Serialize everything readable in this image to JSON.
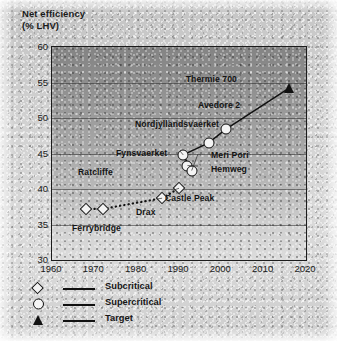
{
  "chart_data": {
    "type": "scatter",
    "title": "",
    "ylabel": "Net efficiency (% LHV)",
    "ylabel_line1": "Net efficiency",
    "ylabel_line2": "(% LHV)",
    "xlabel": "",
    "xlim": [
      1960,
      2020
    ],
    "ylim": [
      30,
      60
    ],
    "xticks": [
      1960,
      1970,
      1980,
      1990,
      2000,
      2010,
      2020
    ],
    "yticks": [
      30,
      35,
      40,
      45,
      50,
      55,
      60
    ],
    "grid": true,
    "grid_axis": "y",
    "legend_position": "below-axes-left",
    "series": [
      {
        "name": "Subcritical",
        "marker": "diamond",
        "line": "dotted",
        "points": [
          {
            "label": "Ferrybridge",
            "x": 1968,
            "y": 37.2
          },
          {
            "label": "Ratcliffe",
            "x": 1972,
            "y": 37.2
          },
          {
            "label": "Drax",
            "x": 1986,
            "y": 38.7
          },
          {
            "label": "Castle Peak",
            "x": 1990,
            "y": 40.1
          }
        ]
      },
      {
        "name": "Supercritical",
        "marker": "circle",
        "line": "solid",
        "points": [
          {
            "label": "Fynsvaerket",
            "x": 1991,
            "y": 44.8
          },
          {
            "label": "Hemweg",
            "x": 1992,
            "y": 43.3
          },
          {
            "label": "Meri Pori",
            "x": 1993,
            "y": 42.6
          },
          {
            "label": "Nordjyllandsvaerket",
            "x": 1997,
            "y": 46.5
          },
          {
            "label": "Avedore 2",
            "x": 2001,
            "y": 48.4
          }
        ]
      },
      {
        "name": "Target",
        "marker": "triangle",
        "line": "solid",
        "points": [
          {
            "label": "Thermie 700",
            "x": 2016,
            "y": 54.2
          }
        ]
      }
    ],
    "annotations": [
      "Thermie 700",
      "Avedore 2",
      "Nordjyllandsvaerket",
      "Fynsvaerket",
      "Meri Pori",
      "Hemweg",
      "Ratcliffe",
      "Castle Peak",
      "Drax",
      "Ferrybridge"
    ]
  },
  "legend": {
    "items": [
      {
        "label": "Subcritical",
        "marker": "diamond"
      },
      {
        "label": "Supercritical",
        "marker": "circle"
      },
      {
        "label": "Target",
        "marker": "triangle"
      }
    ]
  },
  "colors": {
    "ink": "#111111",
    "plot_background_top": "#848484",
    "plot_background_bottom": "#dcdcdc",
    "paper": "#cfcfcf"
  }
}
